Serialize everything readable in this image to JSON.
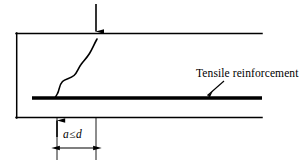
{
  "figure": {
    "background_color": "#ffffff",
    "line_color": "#000000"
  },
  "annotations": {
    "reinforcement_label": "Tensile reinforcement",
    "dimension_symbol_a": "a",
    "dimension_relation": "≤",
    "dimension_symbol_d": "d"
  },
  "geometry": {
    "beam": {
      "left_x": 16,
      "top_y": 33,
      "bottom_y": 118,
      "right_x": 262,
      "outline_width": 1.4,
      "right_edge_open": true
    },
    "reinforcement_bar": {
      "x_start": 32,
      "x_end": 262,
      "y": 98,
      "thickness": 3.2
    },
    "load_arrow": {
      "x": 96,
      "y_start": 4,
      "y_end": 32,
      "direction": "down"
    },
    "crack": {
      "start_x": 97,
      "start_y": 39,
      "end_x": 56,
      "end_y": 97,
      "style": "wavy-s-curve"
    },
    "dimension": {
      "extension_left_x": 57,
      "extension_right_x": 96,
      "extension_top_y": 118,
      "extension_bottom_y": 160,
      "line_y": 148,
      "up_arrow_x": 57,
      "up_arrow_top_y": 120
    },
    "leader": {
      "text_anchor_x": 224,
      "text_anchor_y": 81,
      "arrow_tip_x": 206,
      "arrow_tip_y": 96
    }
  }
}
